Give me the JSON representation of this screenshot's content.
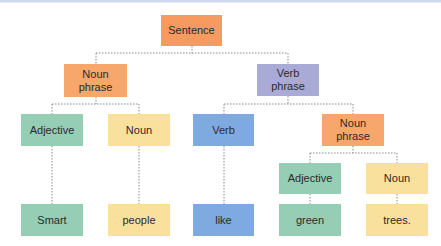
{
  "header": {
    "partial_title_glyphs": "ovp"
  },
  "colors": {
    "sentence": "#F79A60",
    "noun_phrase": "#F7A66C",
    "verb_phrase": "#A9ABD6",
    "adjective": "#95CDB5",
    "noun": "#F9E09C",
    "verb": "#7FA9E1",
    "connector": "#8A8A8A"
  },
  "tree": {
    "sentence": {
      "label": "Sentence"
    },
    "noun_phrase_1": {
      "label": "Noun\nphrase"
    },
    "verb_phrase": {
      "label": "Verb\nphrase"
    },
    "adjective_1": {
      "label": "Adjective"
    },
    "noun_1": {
      "label": "Noun"
    },
    "verb": {
      "label": "Verb"
    },
    "noun_phrase_2": {
      "label": "Noun\nphrase"
    },
    "adjective_2": {
      "label": "Adjective"
    },
    "noun_2": {
      "label": "Noun"
    },
    "word_smart": {
      "label": "Smart"
    },
    "word_people": {
      "label": "people"
    },
    "word_like": {
      "label": "like"
    },
    "word_green": {
      "label": "green"
    },
    "word_trees": {
      "label": "trees."
    }
  }
}
